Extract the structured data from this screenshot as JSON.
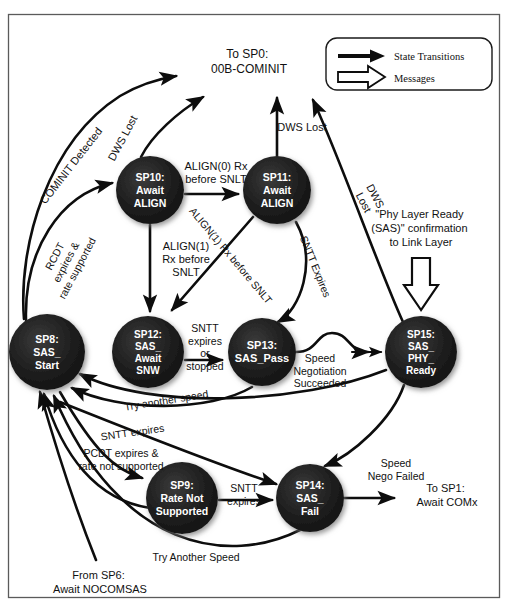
{
  "figure": {
    "frame_color": "#5b5b5b",
    "background": "#ffffff",
    "node_fill": "#1a1a1a",
    "edge_color": "#0d0d0d"
  },
  "legend": {
    "items": [
      {
        "icon": "solid-arrow-icon",
        "label": "State Transitions"
      },
      {
        "icon": "hollow-arrow-icon",
        "label": "Messages"
      }
    ]
  },
  "nodes": [
    {
      "id": "sp8",
      "lines": [
        "SP8:",
        "SAS_",
        "Start"
      ],
      "cx": 47,
      "cy": 352,
      "r": 38
    },
    {
      "id": "sp10",
      "lines": [
        "SP10:",
        "Await",
        "ALIGN"
      ],
      "cx": 150,
      "cy": 190,
      "r": 34
    },
    {
      "id": "sp11",
      "lines": [
        "SP11:",
        "Await",
        "ALIGN"
      ],
      "cx": 277,
      "cy": 190,
      "r": 34
    },
    {
      "id": "sp12",
      "lines": [
        "SP12:",
        "SAS_",
        "Await",
        "SNW"
      ],
      "cx": 148,
      "cy": 352,
      "r": 36
    },
    {
      "id": "sp13",
      "lines": [
        "SP13:",
        "SAS_Pass"
      ],
      "cx": 262,
      "cy": 352,
      "r": 34
    },
    {
      "id": "sp15",
      "lines": [
        "SP15:",
        "SAS_",
        "PHY_",
        "Ready"
      ],
      "cx": 421,
      "cy": 352,
      "r": 36
    },
    {
      "id": "sp9",
      "lines": [
        "SP9:",
        "Rate Not",
        "Supported"
      ],
      "cx": 182,
      "cy": 498,
      "r": 36
    },
    {
      "id": "sp14",
      "lines": [
        "SP14:",
        "SAS_",
        "Fail"
      ],
      "cx": 310,
      "cy": 498,
      "r": 34
    }
  ],
  "edge_labels": [
    {
      "id": "cominit-detected",
      "text": "COMINIT Detected",
      "lines": [
        "COMINIT Detected"
      ]
    },
    {
      "id": "rcdt-expires",
      "lines": [
        "RCDT",
        "expires &",
        "rate supported"
      ]
    },
    {
      "id": "dws-lost-sp10",
      "lines": [
        "DWS Lost"
      ]
    },
    {
      "id": "dws-lost-sp11",
      "lines": [
        "DWS Lost"
      ]
    },
    {
      "id": "dws-lost-sp15",
      "lines": [
        "DWS",
        "Lost"
      ]
    },
    {
      "id": "align0-rx",
      "lines": [
        "ALIGN(0) Rx",
        "before SNLT"
      ]
    },
    {
      "id": "align1-rx-sp10",
      "lines": [
        "ALIGN(1)",
        "Rx before",
        "SNLT"
      ]
    },
    {
      "id": "align1-rx-sp11",
      "lines": [
        "ALIGN(1) Rx before SNLT"
      ]
    },
    {
      "id": "sntt-expires-sp11",
      "lines": [
        "SNTT Expires"
      ]
    },
    {
      "id": "sntt-expires-or-stopped",
      "lines": [
        "SNTT",
        "expires",
        "or",
        "stopped"
      ]
    },
    {
      "id": "speed-nego-succeeded",
      "lines": [
        "Speed",
        "Negotiation",
        "Succeeded"
      ]
    },
    {
      "id": "try-another-speed-1",
      "lines": [
        "Try another speed"
      ]
    },
    {
      "id": "sntt-expires-mid",
      "lines": [
        "SNTT expires"
      ]
    },
    {
      "id": "pcdt-expires",
      "lines": [
        "PCDT expires &",
        "rate not supported"
      ]
    },
    {
      "id": "sntt-expires-sp9",
      "lines": [
        "SNTT",
        "expires"
      ]
    },
    {
      "id": "speed-nego-failed",
      "lines": [
        "Speed",
        "Nego Failed"
      ]
    },
    {
      "id": "try-another-speed-2",
      "lines": [
        "Try Another Speed"
      ]
    }
  ],
  "annotations": [
    {
      "id": "to-sp0",
      "lines": [
        "To SP0:",
        "00B-COMINIT"
      ]
    },
    {
      "id": "phy-ready-msg",
      "lines": [
        "\"Phy Layer Ready",
        "(SAS)\" confirmation",
        "to Link Layer"
      ]
    },
    {
      "id": "to-sp1",
      "lines": [
        "To SP1:",
        "Await COMx"
      ]
    },
    {
      "id": "from-sp6",
      "lines": [
        "From SP6:",
        "Await NOCOMSAS"
      ]
    }
  ]
}
